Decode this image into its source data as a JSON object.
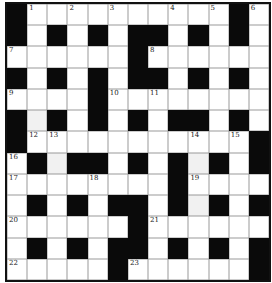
{
  "puzzle": {
    "type": "crossword",
    "rows": 13,
    "cols": 13,
    "grid": [
      "#..........#.",
      "#.#.#.##.#.#.",
      "......#......",
      "#.#.#.##.#.#.",
      "....#........",
      "#.#.#.#.##.#.",
      "#...........#",
      ".#.##.#.#.#.#",
      "........#....",
      ".#.#.##.#.#.#",
      "......#......",
      ".#.#.##.#.#.#",
      ".....#......#"
    ],
    "numbers": [
      {
        "row": 0,
        "col": 1,
        "n": "1"
      },
      {
        "row": 0,
        "col": 3,
        "n": "2"
      },
      {
        "row": 0,
        "col": 5,
        "n": "3"
      },
      {
        "row": 0,
        "col": 8,
        "n": "4"
      },
      {
        "row": 0,
        "col": 10,
        "n": "5"
      },
      {
        "row": 0,
        "col": 12,
        "n": "6"
      },
      {
        "row": 2,
        "col": 0,
        "n": "7"
      },
      {
        "row": 2,
        "col": 7,
        "n": "8"
      },
      {
        "row": 4,
        "col": 0,
        "n": "9"
      },
      {
        "row": 4,
        "col": 5,
        "n": "10"
      },
      {
        "row": 4,
        "col": 7,
        "n": "11"
      },
      {
        "row": 6,
        "col": 1,
        "n": "12"
      },
      {
        "row": 6,
        "col": 2,
        "n": "13"
      },
      {
        "row": 6,
        "col": 9,
        "n": "14"
      },
      {
        "row": 6,
        "col": 11,
        "n": "15"
      },
      {
        "row": 7,
        "col": 0,
        "n": "16"
      },
      {
        "row": 8,
        "col": 0,
        "n": "17"
      },
      {
        "row": 8,
        "col": 4,
        "n": "18"
      },
      {
        "row": 8,
        "col": 9,
        "n": "19"
      },
      {
        "row": 10,
        "col": 0,
        "n": "20"
      },
      {
        "row": 10,
        "col": 7,
        "n": "21"
      },
      {
        "row": 12,
        "col": 0,
        "n": "22"
      },
      {
        "row": 12,
        "col": 6,
        "n": "23"
      }
    ],
    "shaded_cells": [
      {
        "row": 5,
        "col": 1
      },
      {
        "row": 7,
        "col": 2
      },
      {
        "row": 7,
        "col": 9
      },
      {
        "row": 9,
        "col": 9
      }
    ],
    "entries": {}
  }
}
